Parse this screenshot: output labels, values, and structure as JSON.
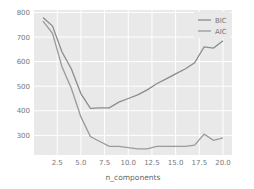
{
  "chart_data": {
    "type": "line",
    "title": "",
    "xlabel": "n_components",
    "ylabel": "",
    "x": [
      1,
      2,
      3,
      4,
      5,
      6,
      7,
      8,
      9,
      10,
      11,
      12,
      13,
      14,
      15,
      16,
      17,
      18,
      19,
      20
    ],
    "series": [
      {
        "name": "BIC",
        "color": "#8c8c8c",
        "values": [
          780,
          745,
          640,
          570,
          470,
          410,
          412,
          412,
          435,
          450,
          465,
          485,
          510,
          530,
          550,
          570,
          595,
          660,
          655,
          685
        ]
      },
      {
        "name": "AIC",
        "color": "#9a9a9a",
        "values": [
          765,
          715,
          580,
          490,
          375,
          295,
          275,
          255,
          255,
          250,
          245,
          245,
          255,
          255,
          255,
          255,
          260,
          305,
          280,
          290
        ]
      }
    ],
    "xlim": [
      0.05,
      20.95
    ],
    "ylim": [
      220,
      810
    ],
    "xticks": [
      2.5,
      5.0,
      7.5,
      10.0,
      12.5,
      15.0,
      17.5,
      20.0
    ],
    "xtick_labels": [
      "2.5",
      "5.0",
      "7.5",
      "10.0",
      "12.5",
      "15.0",
      "17.5",
      "20.0"
    ],
    "yticks": [
      300,
      400,
      500,
      600,
      700,
      800
    ],
    "ytick_labels": [
      "300",
      "400",
      "500",
      "600",
      "700",
      "800"
    ],
    "grid": true,
    "legend_position": "upper right",
    "background": "#e9e9e9"
  }
}
